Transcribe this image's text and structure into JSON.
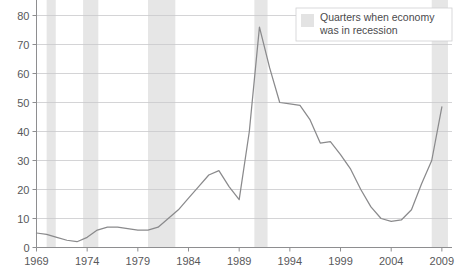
{
  "chart_data": {
    "type": "line",
    "title": "",
    "subtitle": "",
    "xlabel": "",
    "ylabel": "",
    "xlim": [
      1969,
      2010
    ],
    "ylim": [
      0,
      80
    ],
    "ytick_labels": [
      "0",
      "10",
      "20",
      "30",
      "40",
      "50",
      "60",
      "70",
      "80"
    ],
    "ytick_values": [
      0,
      10,
      20,
      30,
      40,
      50,
      60,
      70,
      80
    ],
    "xtick_labels": [
      "1969",
      "1974",
      "1979",
      "1984",
      "1989",
      "1994",
      "1999",
      "2004",
      "2009"
    ],
    "xtick_values": [
      1969,
      1974,
      1979,
      1984,
      1989,
      1994,
      1999,
      2004,
      2009
    ],
    "grid": true,
    "legend_position": "top-right",
    "legend": [
      {
        "label_line1": "Quarters when economy",
        "label_line2": "was in recession",
        "swatch_color": "#e3e3e3",
        "type": "band"
      }
    ],
    "series": [
      {
        "name": "value",
        "color": "#8a8a8c",
        "x": [
          1969,
          1970,
          1971,
          1972,
          1973,
          1974,
          1975,
          1976,
          1977,
          1978,
          1979,
          1980,
          1981,
          1982,
          1983,
          1984,
          1985,
          1986,
          1987,
          1988,
          1989,
          1990,
          1991,
          1992,
          1993,
          1994,
          1995,
          1996,
          1997,
          1998,
          1999,
          2000,
          2001,
          2002,
          2003,
          2004,
          2005,
          2006,
          2007,
          2008,
          2009
        ],
        "values": [
          5,
          4.5,
          3.5,
          2.5,
          2,
          3.5,
          6,
          7,
          7,
          6.5,
          6,
          6,
          7,
          10,
          13,
          17,
          21,
          25,
          26.5,
          21,
          16.5,
          40,
          76,
          62,
          50,
          49.5,
          49,
          44,
          36,
          36.5,
          32,
          27,
          20,
          14,
          10,
          9,
          9.5,
          13,
          22,
          30,
          48.5
        ]
      }
    ],
    "recession_bands": [
      {
        "start": 1970.0,
        "end": 1970.9
      },
      {
        "start": 1973.6,
        "end": 1975.1
      },
      {
        "start": 1980.0,
        "end": 1982.7
      },
      {
        "start": 1990.5,
        "end": 1991.8
      },
      {
        "start": 2008.0,
        "end": 2009.6
      }
    ]
  }
}
